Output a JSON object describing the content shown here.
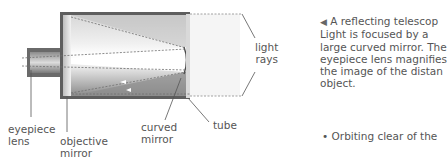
{
  "diagram": {
    "labels": {
      "eyepiece_lens": [
        "eyepiece",
        "lens"
      ],
      "objective_mirror": [
        "objective",
        "mirror"
      ],
      "curved_mirror": [
        "curved",
        "mirror"
      ],
      "tube": "tube",
      "light_rays": [
        "light",
        "rays"
      ]
    },
    "colors": {
      "tube_frame": "#5e5e5e",
      "tube_inner_light": "#e6e6e6",
      "tube_inner_dark": "#9a9a9a",
      "light_region": "#f4f4f4",
      "dashed_ray": "#7a7a7a",
      "leader_line": "#555555"
    }
  },
  "caption": {
    "arrow_icon": "◀",
    "lines": [
      "A reflecting telescop",
      "Light is focused by a",
      "large curved mirror. The",
      "eyepiece lens magnifies",
      "the image of the distan",
      "object."
    ]
  },
  "bullet": {
    "symbol": "•",
    "text": "Orbiting clear of the"
  }
}
